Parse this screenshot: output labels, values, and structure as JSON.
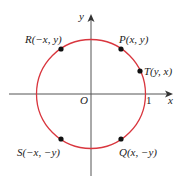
{
  "diagram": {
    "type": "unit-circle-symmetry",
    "axes": {
      "x_label": "x",
      "y_label": "y",
      "origin_label": "O",
      "x_tick_label": "1"
    },
    "circle": {
      "color": "#d9363e",
      "radius_units": 1
    },
    "points": [
      {
        "id": "P",
        "label": "P(x, y)",
        "angle_deg": 55
      },
      {
        "id": "T",
        "label": "T(y, x)",
        "angle_deg": 35
      },
      {
        "id": "R",
        "label": "R(−x, y)",
        "angle_deg": 125
      },
      {
        "id": "S",
        "label": "S(−x, −y)",
        "angle_deg": 235
      },
      {
        "id": "Q",
        "label": "Q(x, −y)",
        "angle_deg": 305
      }
    ],
    "colors": {
      "axis": "#555555",
      "point": "#111111",
      "circle": "#d9363e"
    }
  }
}
